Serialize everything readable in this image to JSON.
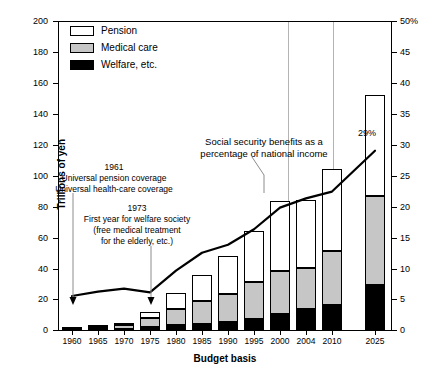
{
  "chart_data": {
    "type": "bar",
    "title": "",
    "xlabel": "Budget basis",
    "ylabel": "Trillions of yen",
    "y2label": "",
    "ylim": [
      0,
      200
    ],
    "y2lim": [
      0,
      50
    ],
    "yticks": [
      "0",
      "20",
      "40",
      "60",
      "80",
      "100",
      "120",
      "140",
      "160",
      "180",
      "200"
    ],
    "y2ticks": [
      "0",
      "5",
      "10",
      "15",
      "20",
      "25",
      "30",
      "35",
      "40",
      "45",
      "50%"
    ],
    "grid": false,
    "legend_position": "top-left",
    "categories": [
      "1960",
      "1965",
      "1970",
      "1975",
      "1980",
      "1985",
      "1990",
      "1995",
      "2000",
      "2004",
      "2010",
      "2025"
    ],
    "series": [
      {
        "name": "Welfare, etc.",
        "color": "#000000",
        "values": [
          0.3,
          0.6,
          0.9,
          2.0,
          3.0,
          4.0,
          5.0,
          7.0,
          10.5,
          13.5,
          16.0,
          29.0
        ]
      },
      {
        "name": "Medical care",
        "color": "#c6c6c6",
        "values": [
          0.4,
          1.1,
          2.1,
          5.8,
          10.5,
          14.5,
          18.5,
          24.0,
          28.0,
          26.5,
          35.0,
          58.0
        ]
      },
      {
        "name": "Pension",
        "color": "#ffffff",
        "values": [
          0.3,
          0.8,
          1.5,
          3.7,
          10.5,
          17.0,
          24.5,
          33.0,
          45.0,
          44.0,
          53.0,
          65.0
        ]
      }
    ],
    "totals": [
      1.0,
      2.5,
      4.5,
      11.5,
      24.0,
      35.5,
      48.0,
      64.0,
      83.5,
      84.0,
      104.0,
      152.0
    ],
    "line_series": {
      "name": "Social security benefits as a percentage of national income",
      "axis": "right",
      "unit": "%",
      "color": "#000000",
      "x": [
        "1960",
        "1965",
        "1970",
        "1975",
        "1980",
        "1985",
        "1990",
        "1995",
        "2000",
        "2004",
        "2010",
        "2025"
      ],
      "values": [
        5.5,
        6.2,
        6.7,
        6.1,
        9.6,
        12.5,
        13.8,
        16.3,
        19.8,
        21.3,
        22.4,
        29.0
      ]
    },
    "annotations": [
      {
        "id": "anno-1961",
        "year": "1961",
        "lines": [
          "Universal pension coverage",
          "Universal health-care coverage"
        ],
        "target": "1960"
      },
      {
        "id": "anno-1973",
        "year": "1973",
        "lines": [
          "First year for welfare society",
          "(free medical treatment",
          "for the elderly, etc.)"
        ],
        "target": "1975"
      },
      {
        "id": "anno-line",
        "year": "",
        "lines": [
          "Social security benefits as a",
          "percentage of national income"
        ],
        "target": "line"
      }
    ],
    "data_labels": [
      {
        "id": "pct-2025",
        "text": "29%",
        "series": "line",
        "category": "2025"
      }
    ]
  },
  "legend": {
    "items": [
      {
        "label": "Pension",
        "swatch": "pension-swatch"
      },
      {
        "label": "Medical care",
        "swatch": "medical-swatch"
      },
      {
        "label": "Welfare, etc.",
        "swatch": "welfare-swatch"
      }
    ]
  }
}
